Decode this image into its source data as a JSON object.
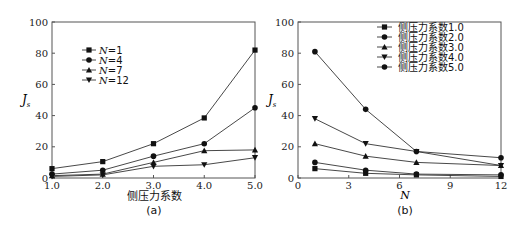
{
  "chart_data": [
    {
      "type": "line",
      "panel": "(a)",
      "title": "",
      "xlabel": "侧压力系数",
      "ylabel": "J_s",
      "categories": [
        "1.0",
        "2.0",
        "3.0",
        "4.0",
        "5.0"
      ],
      "x": [
        1.0,
        2.0,
        3.0,
        4.0,
        5.0
      ],
      "xlim": [
        1.0,
        5.0
      ],
      "ylim": [
        0,
        100
      ],
      "yticks": [
        0,
        20,
        40,
        60,
        80,
        100
      ],
      "xticks": [
        "1.0",
        "2.0",
        "3.0",
        "4.0",
        "5.0"
      ],
      "legend_position": "upper-left",
      "grid": false,
      "series": [
        {
          "name": "N=1",
          "marker": "square",
          "values": [
            6,
            10.5,
            22,
            38.5,
            82
          ]
        },
        {
          "name": "N=4",
          "marker": "circle",
          "values": [
            2.5,
            5,
            14,
            22,
            45
          ]
        },
        {
          "name": "N=7",
          "marker": "triangle-up",
          "values": [
            1.5,
            2.5,
            10,
            17.5,
            18
          ]
        },
        {
          "name": "N=12",
          "marker": "triangle-down",
          "values": [
            1,
            2,
            7.5,
            8.5,
            13
          ]
        }
      ]
    },
    {
      "type": "line",
      "panel": "(b)",
      "title": "",
      "xlabel": "N",
      "ylabel": "J_s",
      "x": [
        1,
        4,
        7,
        12
      ],
      "xlim": [
        0,
        12
      ],
      "ylim": [
        0,
        100
      ],
      "yticks": [
        0,
        20,
        40,
        60,
        80,
        100
      ],
      "xticks": [
        "0",
        "3",
        "6",
        "9",
        "12"
      ],
      "legend_position": "upper-right",
      "grid": false,
      "series": [
        {
          "name": "侧压力系数1.0",
          "marker": "square",
          "values": [
            6,
            3,
            2,
            1
          ]
        },
        {
          "name": "侧压力系数2.0",
          "marker": "circle",
          "values": [
            10,
            5,
            2.5,
            2
          ]
        },
        {
          "name": "侧压力系数3.0",
          "marker": "triangle-up",
          "values": [
            22,
            14,
            10,
            8
          ]
        },
        {
          "name": "侧压力系数4.0",
          "marker": "triangle-down",
          "values": [
            38,
            22,
            17,
            8
          ]
        },
        {
          "name": "侧压力系数5.0",
          "marker": "circle",
          "values": [
            81,
            44,
            17,
            13
          ]
        }
      ]
    }
  ],
  "panels": {
    "a": {
      "caption": "(a)",
      "xlabel": "侧压力系数",
      "ylabel_main": "J",
      "ylabel_sub": "s",
      "xticks": [
        "1.0",
        "2.0",
        "3.0",
        "4.0",
        "5.0"
      ],
      "yticks": [
        "0",
        "20",
        "40",
        "60",
        "80",
        "100"
      ],
      "legend": [
        {
          "prefix": "N",
          "suffix": "=1"
        },
        {
          "prefix": "N",
          "suffix": "=4"
        },
        {
          "prefix": "N",
          "suffix": "=7"
        },
        {
          "prefix": "N",
          "suffix": "=12"
        }
      ]
    },
    "b": {
      "caption": "(b)",
      "xlabel": "N",
      "ylabel_main": "J",
      "ylabel_sub": "s",
      "xticks": [
        "0",
        "3",
        "6",
        "9",
        "12"
      ],
      "yticks": [
        "0",
        "20",
        "40",
        "60",
        "80",
        "100"
      ],
      "legend": [
        "侧压力系数1.0",
        "侧压力系数2.0",
        "侧压力系数3.0",
        "侧压力系数4.0",
        "侧压力系数5.0"
      ]
    }
  }
}
